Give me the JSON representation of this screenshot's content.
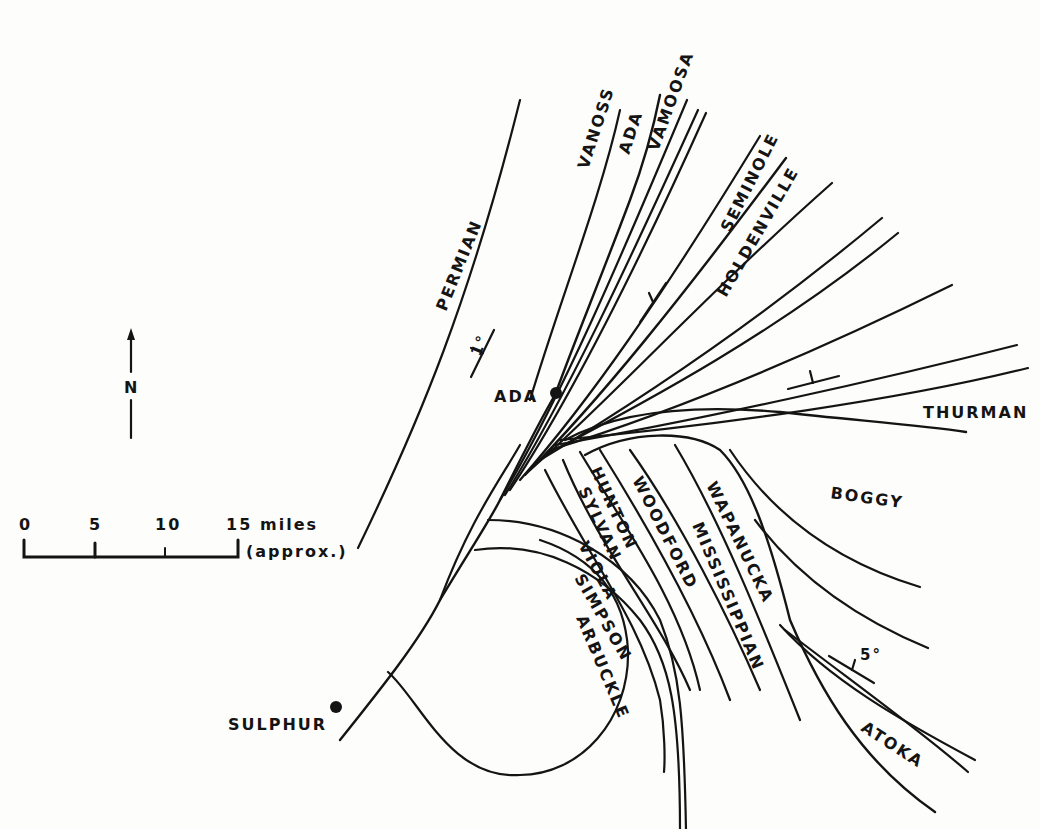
{
  "map": {
    "formations": {
      "permian": "PERMIAN",
      "vanoss": "VANOSS",
      "ada": "ADA",
      "vamoosa": "VAMOOSA",
      "seminole": "SEMINOLE",
      "holdenville": "HOLDENVILLE",
      "thurman": "THURMAN",
      "boggy": "BOGGY",
      "hunton": "HUNTON",
      "sylvan": "SYLVAN",
      "viola": "VIOLA",
      "simpson": "SIMPSON",
      "arbuckle": "ARBUCKLE",
      "woodford": "WOODFORD",
      "mississippian": "MISSISSIPPIAN",
      "wapanucka": "WAPANUCKA",
      "atoka": "ATOKA"
    },
    "towns": {
      "ada": "ADA",
      "sulphur": "SULPHUR"
    },
    "dips": {
      "west": "1°",
      "southeast": "5°"
    },
    "north_arrow": "N",
    "scale": {
      "ticks": [
        "0",
        "5",
        "10",
        "15"
      ],
      "unit": "miles",
      "note": "(approx.)"
    }
  }
}
